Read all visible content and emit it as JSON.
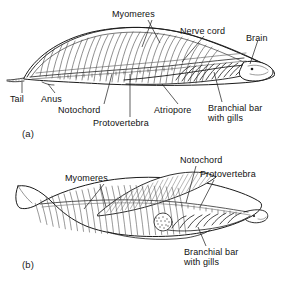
{
  "figure": {
    "background_color": "#ffffff",
    "ink_color": "#1a1a1a",
    "shade_color": "#9a9a9a"
  },
  "panels": [
    {
      "id": "a",
      "tag": "(a)",
      "labels": [
        {
          "key": "myomeres",
          "text": "Myomeres"
        },
        {
          "key": "nerve_cord",
          "text": "Nerve cord"
        },
        {
          "key": "brain",
          "text": "Brain"
        },
        {
          "key": "tail",
          "text": "Tail"
        },
        {
          "key": "anus",
          "text": "Anus"
        },
        {
          "key": "notochord",
          "text": "Notochord"
        },
        {
          "key": "protovertebra",
          "text": "Protovertebra"
        },
        {
          "key": "atriopore",
          "text": "Atriopore"
        },
        {
          "key": "branchial_line1",
          "text": "Branchial bar"
        },
        {
          "key": "branchial_line2",
          "text": "with gills"
        }
      ]
    },
    {
      "id": "b",
      "tag": "(b)",
      "labels": [
        {
          "key": "myomeres",
          "text": "Myomeres"
        },
        {
          "key": "notochord",
          "text": "Notochord"
        },
        {
          "key": "protovertebra",
          "text": "Protovertebra"
        },
        {
          "key": "branchial_line1",
          "text": "Branchial bar"
        },
        {
          "key": "branchial_line2",
          "text": "with gills"
        }
      ]
    }
  ],
  "panel_a": {
    "tag": "(a)",
    "myomeres": "Myomeres",
    "nerve_cord": "Nerve cord",
    "brain": "Brain",
    "tail": "Tail",
    "anus": "Anus",
    "notochord": "Notochord",
    "protovertebra": "Protovertebra",
    "atriopore": "Atriopore",
    "branchial_1": "Branchial bar",
    "branchial_2": "with gills"
  },
  "panel_b": {
    "tag": "(b)",
    "myomeres": "Myomeres",
    "notochord": "Notochord",
    "protovertebra": "Protovertebra",
    "branchial_1": "Branchial bar",
    "branchial_2": "with gills"
  }
}
